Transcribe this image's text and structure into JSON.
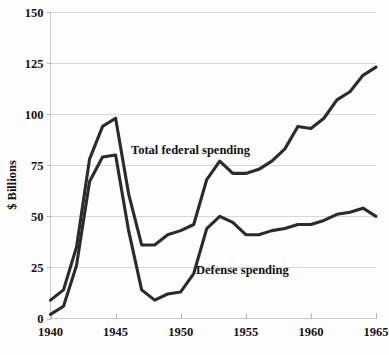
{
  "chart_data": {
    "type": "line",
    "title": "",
    "xlabel": "",
    "ylabel": "$ Billions",
    "xlim": [
      1940,
      1965
    ],
    "ylim": [
      0,
      150
    ],
    "grid": true,
    "legend_position": "inline-annotations",
    "x": [
      1940,
      1941,
      1942,
      1943,
      1944,
      1945,
      1946,
      1947,
      1948,
      1949,
      1950,
      1951,
      1952,
      1953,
      1954,
      1955,
      1956,
      1957,
      1958,
      1959,
      1960,
      1961,
      1962,
      1963,
      1964,
      1965
    ],
    "x_ticks": [
      1940,
      1945,
      1950,
      1955,
      1960,
      1965
    ],
    "x_tick_labels": [
      "1940",
      "1945",
      "1950",
      "1955",
      "1960",
      "1965"
    ],
    "y_ticks": [
      0,
      25,
      50,
      75,
      100,
      125,
      150
    ],
    "y_tick_labels": [
      "0",
      "25",
      "50",
      "75",
      "100",
      "125",
      "150"
    ],
    "series": [
      {
        "name": "Total federal spending",
        "annotation": "Total federal spending",
        "color": "#2b2b2b",
        "values": [
          9,
          14,
          35,
          78,
          94,
          98,
          61,
          36,
          36,
          41,
          43,
          46,
          68,
          77,
          71,
          71,
          73,
          77,
          83,
          94,
          93,
          98,
          107,
          111,
          119,
          123
        ]
      },
      {
        "name": "Defense spending",
        "annotation": "Defense spending",
        "color": "#2b2b2b",
        "values": [
          2,
          6,
          26,
          67,
          79,
          80,
          43,
          14,
          9,
          12,
          13,
          22,
          44,
          50,
          47,
          41,
          41,
          43,
          44,
          46,
          46,
          48,
          51,
          52,
          54,
          50
        ]
      }
    ]
  },
  "annotations": {
    "total_federal_label": "Total federal spending",
    "defense_label": "Defense spending"
  },
  "axes": {
    "y_axis_title": "$ Billions"
  }
}
